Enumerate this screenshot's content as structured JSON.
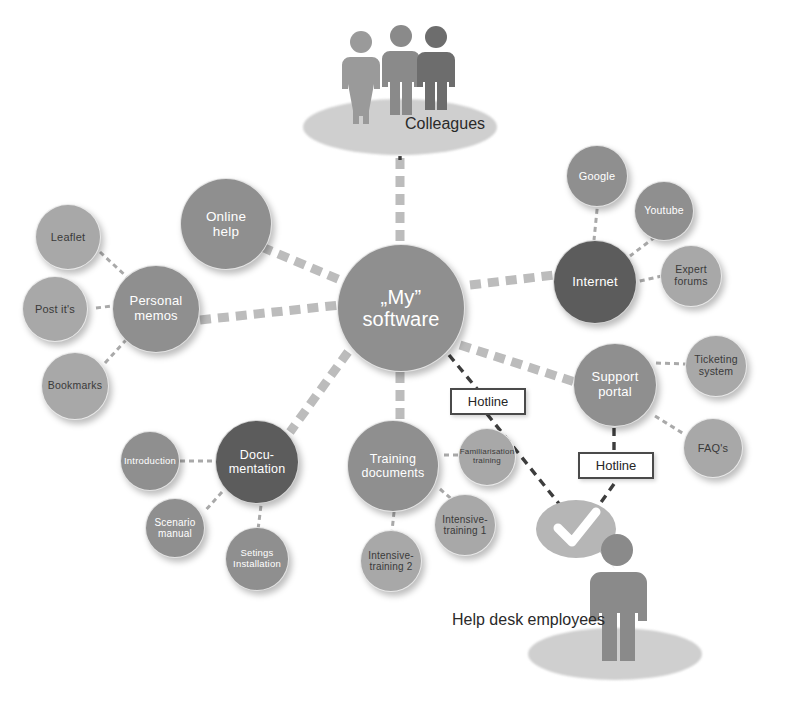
{
  "diagram": {
    "background_color": "#ffffff",
    "center": {
      "label_line1": "„My”",
      "label_line2": "software",
      "color": "#8f8f8f"
    },
    "groups": [
      {
        "name": "personal-memos",
        "hub": {
          "label": "Personal\nmemos",
          "color": "#8f8f8f"
        },
        "children": [
          {
            "label": "Leaflet",
            "color": "#a8a8a8"
          },
          {
            "label": "Post it's",
            "color": "#a8a8a8"
          },
          {
            "label": "Bookmarks",
            "color": "#a8a8a8"
          }
        ]
      },
      {
        "name": "online-help",
        "hub": {
          "label": "Online\nhelp",
          "color": "#8f8f8f"
        },
        "children": []
      },
      {
        "name": "internet",
        "hub": {
          "label": "Internet",
          "color": "#5c5c5c"
        },
        "children": [
          {
            "label": "Google",
            "color": "#8f8f8f"
          },
          {
            "label": "Youtube",
            "color": "#8f8f8f"
          },
          {
            "label": "Expert\nforums",
            "color": "#a8a8a8"
          }
        ]
      },
      {
        "name": "support-portal",
        "hub": {
          "label": "Support\nportal",
          "color": "#8f8f8f"
        },
        "children": [
          {
            "label": "Ticketing\nsystem",
            "color": "#a8a8a8"
          },
          {
            "label": "FAQ's",
            "color": "#a8a8a8"
          }
        ]
      },
      {
        "name": "documentation",
        "hub": {
          "label": "Docu-\nmentation",
          "color": "#5c5c5c"
        },
        "children": [
          {
            "label": "Introduction",
            "color": "#8f8f8f"
          },
          {
            "label": "Scenario\nmanual",
            "color": "#8f8f8f"
          },
          {
            "label": "Setings\nInstallation",
            "color": "#8f8f8f"
          }
        ]
      },
      {
        "name": "training-documents",
        "hub": {
          "label": "Training\ndocuments",
          "color": "#8f8f8f"
        },
        "children": [
          {
            "label": "Familiarisation\ntraining",
            "color": "#a8a8a8"
          },
          {
            "label": "Intensive-\ntraining 1",
            "color": "#a8a8a8"
          },
          {
            "label": "Intensive-\ntraining 2",
            "color": "#a8a8a8"
          }
        ]
      }
    ],
    "nodes": {
      "center_line1": "„My”",
      "center_line2": "software",
      "personal_memos_l1": "Personal",
      "personal_memos_l2": "memos",
      "online_help_l1": "Online",
      "online_help_l2": "help",
      "leaflet": "Leaflet",
      "post_its": "Post it's",
      "bookmarks": "Bookmarks",
      "internet": "Internet",
      "google": "Google",
      "youtube": "Youtube",
      "expert_forums_l1": "Expert",
      "expert_forums_l2": "forums",
      "support_portal_l1": "Support",
      "support_portal_l2": "portal",
      "ticketing_l1": "Ticketing",
      "ticketing_l2": "system",
      "faqs": "FAQ's",
      "documentation_l1": "Docu-",
      "documentation_l2": "mentation",
      "introduction": "Introduction",
      "scenario_l1": "Scenario",
      "scenario_l2": "manual",
      "settings_l1": "Setings",
      "settings_l2": "Installation",
      "training_l1": "Training",
      "training_l2": "documents",
      "familiarisation_l1": "Familiarisation",
      "familiarisation_l2": "training",
      "intensive1_l1": "Intensive-",
      "intensive1_l2": "training 1",
      "intensive2_l1": "Intensive-",
      "intensive2_l2": "training 2"
    },
    "boxes": {
      "hotline_upper": "Hotline",
      "hotline_lower": "Hotline"
    },
    "people": {
      "colleagues_label": "Colleagues",
      "helpdesk_label": "Help desk employees",
      "colleagues_count": 3,
      "helpdesk_count": 1,
      "speech_bubble_icon": "check-icon"
    },
    "colors": {
      "node_mid": "#8f8f8f",
      "node_dark": "#5c5c5c",
      "node_light": "#a8a8a8",
      "link_main": "#b9b9b9",
      "link_hotline": "#3d3d3d",
      "figure": "#8a8a8a",
      "figure_dark": "#636363",
      "platform": "#c9c9c9",
      "text_dark": "#3a3a3a",
      "text_light": "#ffffff"
    },
    "links": [
      {
        "from": "colleagues",
        "to": "center",
        "style": "thick-dashed"
      },
      {
        "from": "online-help",
        "to": "center",
        "style": "thick-dashed"
      },
      {
        "from": "personal-memos",
        "to": "center",
        "style": "thick-dashed"
      },
      {
        "from": "internet",
        "to": "center",
        "style": "thick-dashed"
      },
      {
        "from": "support-portal",
        "to": "center",
        "style": "thick-dashed"
      },
      {
        "from": "documentation",
        "to": "center",
        "style": "thick-dashed"
      },
      {
        "from": "training-documents",
        "to": "center",
        "style": "thick-dashed"
      },
      {
        "from": "center",
        "to": "hotline-upper",
        "style": "thin-dashed-dark"
      },
      {
        "from": "hotline-upper",
        "to": "helpdesk",
        "style": "thin-dashed-dark"
      },
      {
        "from": "support-portal",
        "to": "hotline-lower",
        "style": "thin-dashed-dark"
      },
      {
        "from": "hotline-lower",
        "to": "helpdesk",
        "style": "thin-dashed-dark"
      }
    ]
  }
}
